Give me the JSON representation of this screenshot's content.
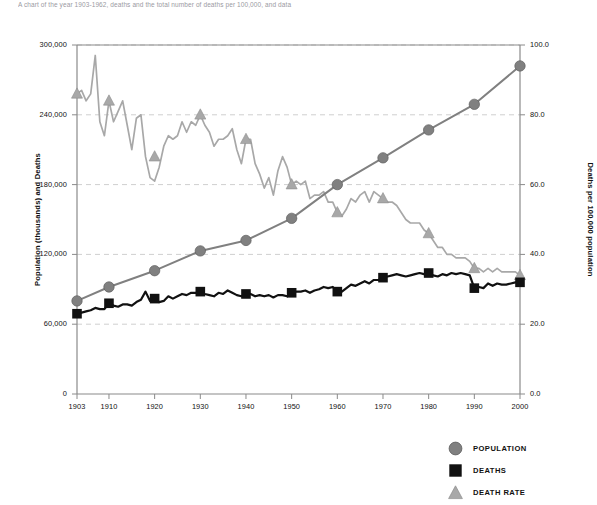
{
  "caption": "A chart of the year 1903-1962, deaths and the total number of deaths per 100,000, and data",
  "chart_data": {
    "type": "line",
    "title": "",
    "xlabel": "",
    "ylabel": "Population (thousands) and Deaths",
    "y2label": "Deaths per 100,000 population",
    "xlim": [
      1903,
      2000
    ],
    "ylim": [
      0,
      300000
    ],
    "y2lim": [
      0.0,
      100.0
    ],
    "grid": true,
    "legend_position": "bottom-right",
    "x_ticks": [
      "1903",
      "1910",
      "1920",
      "1930",
      "1940",
      "1950",
      "1960",
      "1970",
      "1980",
      "1990",
      "2000"
    ],
    "y_ticks": [
      "0",
      "60,000",
      "120,000",
      "180,000",
      "240,000",
      "300,000"
    ],
    "y2_ticks": [
      "0.0",
      "20.0",
      "40.0",
      "60.0",
      "80.0",
      "100.0"
    ],
    "colors": {
      "population": "#808080",
      "deaths": "#111111",
      "death_rate": "#a8a8a8",
      "gridline": "#cfcfcf",
      "axis": "#8a8a8a"
    },
    "series": [
      {
        "name": "POPULATION",
        "axis": "left",
        "marker": "circle",
        "color": "#808080",
        "marker_years": [
          1903,
          1910,
          1920,
          1930,
          1940,
          1950,
          1960,
          1970,
          1980,
          1990,
          2000
        ],
        "marker_values": [
          80000,
          92000,
          106000,
          123000,
          132000,
          151000,
          180000,
          203000,
          227000,
          249000,
          282000
        ],
        "x": [
          1903,
          1910,
          1920,
          1930,
          1940,
          1950,
          1960,
          1970,
          1980,
          1990,
          2000
        ],
        "values": [
          80000,
          92000,
          106000,
          123000,
          132000,
          151000,
          180000,
          203000,
          227000,
          249000,
          282000
        ]
      },
      {
        "name": "DEATHS",
        "axis": "left",
        "marker": "square",
        "color": "#111111",
        "marker_years": [
          1903,
          1910,
          1920,
          1930,
          1940,
          1950,
          1960,
          1970,
          1980,
          1990,
          2000
        ],
        "marker_values": [
          69000,
          78000,
          82000,
          88000,
          86000,
          87000,
          88000,
          100000,
          104000,
          91000,
          96000
        ],
        "x": [
          1903,
          1904,
          1905,
          1906,
          1907,
          1908,
          1909,
          1910,
          1911,
          1912,
          1913,
          1914,
          1915,
          1916,
          1917,
          1918,
          1919,
          1920,
          1921,
          1922,
          1923,
          1924,
          1925,
          1926,
          1927,
          1928,
          1929,
          1930,
          1931,
          1932,
          1933,
          1934,
          1935,
          1936,
          1937,
          1938,
          1939,
          1940,
          1941,
          1942,
          1943,
          1944,
          1945,
          1946,
          1947,
          1948,
          1949,
          1950,
          1951,
          1952,
          1953,
          1954,
          1955,
          1956,
          1957,
          1958,
          1959,
          1960,
          1961,
          1962,
          1963,
          1964,
          1965,
          1966,
          1967,
          1968,
          1969,
          1970,
          1971,
          1972,
          1973,
          1974,
          1975,
          1976,
          1977,
          1978,
          1979,
          1980,
          1981,
          1982,
          1983,
          1984,
          1985,
          1986,
          1987,
          1988,
          1989,
          1990,
          1991,
          1992,
          1993,
          1994,
          1995,
          1996,
          1997,
          1998,
          1999,
          2000
        ],
        "values": [
          69000,
          70000,
          71000,
          72000,
          74000,
          73000,
          73000,
          78000,
          76000,
          75000,
          77000,
          77000,
          76000,
          79000,
          81000,
          88000,
          80000,
          82000,
          79000,
          80000,
          84000,
          82000,
          84000,
          86000,
          85000,
          87000,
          87000,
          88000,
          86000,
          85000,
          84000,
          87000,
          86000,
          89000,
          87000,
          85000,
          84000,
          86000,
          86000,
          84000,
          85000,
          84000,
          85000,
          83000,
          85000,
          85000,
          84000,
          87000,
          88000,
          88000,
          89000,
          87000,
          89000,
          90000,
          92000,
          91000,
          92000,
          88000,
          88000,
          91000,
          94000,
          93000,
          95000,
          97000,
          95000,
          98000,
          98000,
          100000,
          101000,
          102000,
          103000,
          102000,
          101000,
          102000,
          103000,
          104000,
          103000,
          104000,
          102000,
          101000,
          103000,
          102000,
          104000,
          103000,
          104000,
          103000,
          102000,
          91000,
          92000,
          91000,
          95000,
          93000,
          95000,
          94000,
          94000,
          95000,
          96000,
          96000
        ]
      },
      {
        "name": "DEATH RATE",
        "axis": "right",
        "marker": "triangle",
        "color": "#a8a8a8",
        "marker_years": [
          1903,
          1910,
          1920,
          1930,
          1940,
          1950,
          1960,
          1970,
          1980,
          1990,
          2000
        ],
        "marker_values": [
          86.0,
          84.0,
          68.0,
          80.0,
          73.0,
          60.0,
          52.0,
          56.0,
          46.0,
          36.0,
          34.0
        ],
        "x": [
          1903,
          1904,
          1905,
          1906,
          1907,
          1908,
          1909,
          1910,
          1911,
          1912,
          1913,
          1914,
          1915,
          1916,
          1917,
          1918,
          1919,
          1920,
          1921,
          1922,
          1923,
          1924,
          1925,
          1926,
          1927,
          1928,
          1929,
          1930,
          1931,
          1932,
          1933,
          1934,
          1935,
          1936,
          1937,
          1938,
          1939,
          1940,
          1941,
          1942,
          1943,
          1944,
          1945,
          1946,
          1947,
          1948,
          1949,
          1950,
          1951,
          1952,
          1953,
          1954,
          1955,
          1956,
          1957,
          1958,
          1959,
          1960,
          1961,
          1962,
          1963,
          1964,
          1965,
          1966,
          1967,
          1968,
          1969,
          1970,
          1971,
          1972,
          1973,
          1974,
          1975,
          1976,
          1977,
          1978,
          1979,
          1980,
          1981,
          1982,
          1983,
          1984,
          1985,
          1986,
          1987,
          1988,
          1989,
          1990,
          1991,
          1992,
          1993,
          1994,
          1995,
          1996,
          1997,
          1998,
          1999,
          2000
        ],
        "values": [
          86.0,
          87.0,
          84.0,
          86.0,
          97.0,
          78.0,
          74.0,
          84.0,
          78.0,
          81.0,
          84.0,
          77.0,
          70.0,
          79.0,
          80.0,
          68.0,
          62.0,
          61.0,
          65.0,
          71.0,
          74.0,
          73.0,
          74.0,
          78.0,
          75.0,
          78.0,
          77.0,
          80.0,
          77.0,
          75.0,
          71.0,
          73.0,
          73.0,
          74.0,
          76.0,
          70.0,
          66.0,
          73.0,
          73.0,
          66.0,
          63.0,
          59.0,
          62.0,
          57.0,
          64.0,
          68.0,
          65.0,
          60.0,
          61.0,
          60.0,
          61.0,
          56.0,
          57.0,
          57.0,
          58.0,
          55.0,
          55.0,
          52.0,
          51.0,
          53.0,
          56.0,
          55.0,
          57.0,
          58.0,
          55.0,
          58.0,
          57.0,
          56.0,
          55.0,
          55.0,
          54.0,
          52.0,
          50.0,
          49.0,
          49.0,
          49.0,
          47.0,
          46.0,
          44.0,
          42.0,
          42.0,
          40.0,
          40.0,
          39.0,
          39.0,
          39.0,
          38.0,
          36.0,
          36.0,
          35.0,
          36.0,
          35.0,
          36.0,
          35.0,
          35.0,
          35.0,
          35.0,
          34.0
        ]
      }
    ]
  },
  "legend": {
    "items": [
      {
        "label": "POPULATION",
        "marker": "circle",
        "color": "#808080"
      },
      {
        "label": "DEATHS",
        "marker": "square",
        "color": "#111111"
      },
      {
        "label": "DEATH RATE",
        "marker": "triangle",
        "color": "#a8a8a8"
      }
    ]
  }
}
